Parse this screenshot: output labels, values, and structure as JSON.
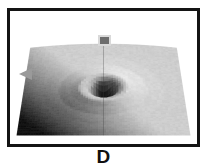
{
  "panel": {
    "label": "D",
    "caption_text": "D"
  },
  "frame": {
    "border_color": "#141414",
    "background_color": "#ffffff",
    "border_width_px": 3
  },
  "markers": {
    "height_marker": {
      "name": "square-marker",
      "shape": "square",
      "fill_color": "#6d6d6d",
      "outline_color": "#d9d9d9"
    },
    "left_cursor": {
      "name": "triangle-cursor",
      "shape": "left-pointing-triangle",
      "fill_color": "#9a9a9a"
    }
  },
  "chart_data": {
    "type": "heatmap",
    "title": "D",
    "subtitle": "",
    "xlabel": "",
    "ylabel": "",
    "zlabel": "",
    "rendering": "grayscale 3D perspective surface plot (shaded relief)",
    "colormap": "grayscale",
    "colormap_min_hex": "#1a1a1a",
    "colormap_max_hex": "#e8e8e8",
    "grid": false,
    "legend": "none",
    "view": {
      "elevation_deg": 28,
      "azimuth_deg": 0,
      "perspective": true
    },
    "nx": 64,
    "ny": 64,
    "x": [
      -1.0,
      1.0
    ],
    "y": [
      -1.0,
      1.0
    ],
    "zlim": [
      -1.0,
      0.35
    ],
    "feature": {
      "kind": "central crater / depression",
      "center_x": 0.0,
      "center_y": 0.02,
      "rim_radius": 0.3,
      "crater_radius": 0.12,
      "depth": -1.0,
      "rim_height": 0.22,
      "plateau_height": 0.0
    },
    "annotations": [
      {
        "name": "vertical-probe-line",
        "x": 0.0,
        "description": "thin vertical line through crater center"
      },
      {
        "name": "square-marker",
        "x": 0.0,
        "y": 1.0,
        "description": "gray square above the surface at the probe axis"
      },
      {
        "name": "triangle-cursor",
        "x": -1.15,
        "y": 0.05,
        "description": "left-pointing gray triangle at left margin"
      }
    ],
    "series": [
      {
        "name": "surface-height",
        "description": "radially symmetric crater profile, darker toward lower-left due to shading",
        "radial_profile_r": [
          0.0,
          0.05,
          0.1,
          0.14,
          0.18,
          0.24,
          0.3,
          0.4,
          0.55,
          0.75,
          1.0
        ],
        "radial_profile_z": [
          -1.0,
          -0.92,
          -0.6,
          -0.15,
          0.08,
          0.19,
          0.22,
          0.14,
          0.05,
          0.01,
          0.0
        ]
      }
    ]
  }
}
